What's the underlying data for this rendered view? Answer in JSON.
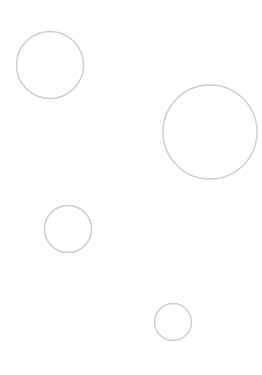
{
  "canvas": {
    "width": 262,
    "height": 375,
    "background": "#ffffff"
  },
  "style": {
    "stroke": "#cfcfcf",
    "stroke_width": 1.5,
    "fill": "none"
  },
  "circles": [
    {
      "cx": 50,
      "cy": 65,
      "r": 33.5
    },
    {
      "cx": 210,
      "cy": 132,
      "r": 47
    },
    {
      "cx": 68,
      "cy": 229,
      "r": 23.5
    },
    {
      "cx": 173,
      "cy": 322,
      "r": 18.5
    }
  ]
}
